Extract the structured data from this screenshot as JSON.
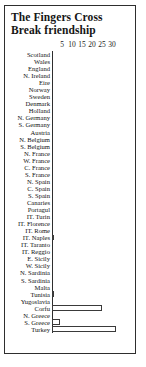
{
  "chart": {
    "title_lines": [
      "The Fingers Cross",
      "Break friendship"
    ],
    "axis": {
      "ticks": [
        "5",
        "10",
        "15",
        "20",
        "25",
        "30"
      ]
    }
  },
  "chart_data": {
    "type": "bar",
    "orientation": "horizontal",
    "title": "The Fingers Cross Break friendship",
    "xlabel": "",
    "ylabel": "",
    "xlim": [
      0,
      33
    ],
    "grid": false,
    "legend": "none",
    "tick_values": [
      5,
      10,
      15,
      20,
      25,
      30
    ],
    "categories": [
      "Scotland",
      "Wales",
      "England",
      "N. Ireland",
      "Eire",
      "Norway",
      "Sweden",
      "Denmark",
      "Holland",
      "N. Germany",
      "S. Germany",
      "Austria",
      "N. Belgium",
      "S. Belgium",
      "N. France",
      "W. France",
      "C. France",
      "S. France",
      "N. Spain",
      "C. Spain",
      "S. Spain",
      "Canaries",
      "Portagul",
      "IT. Turin",
      "IT. Florence",
      "IT. Rome",
      "IT. Naples",
      "IT. Taranto",
      "IT. Reggio",
      "E. Sicily",
      "W. Sicily",
      "N. Sardinia",
      "S. Sardinia",
      "Malta",
      "Tunisia",
      "Yugoslavia",
      "Corfu",
      "N. Greece",
      "S. Greece",
      "Turkey"
    ],
    "values": [
      0,
      0,
      0,
      0,
      0,
      0,
      0,
      0,
      0,
      0,
      0,
      0,
      0,
      0,
      0,
      0,
      0,
      0,
      0,
      0,
      0,
      0,
      0,
      0,
      0,
      0,
      1,
      0,
      0,
      0,
      0,
      0,
      0,
      0,
      1,
      0,
      25,
      0,
      4,
      32
    ]
  }
}
